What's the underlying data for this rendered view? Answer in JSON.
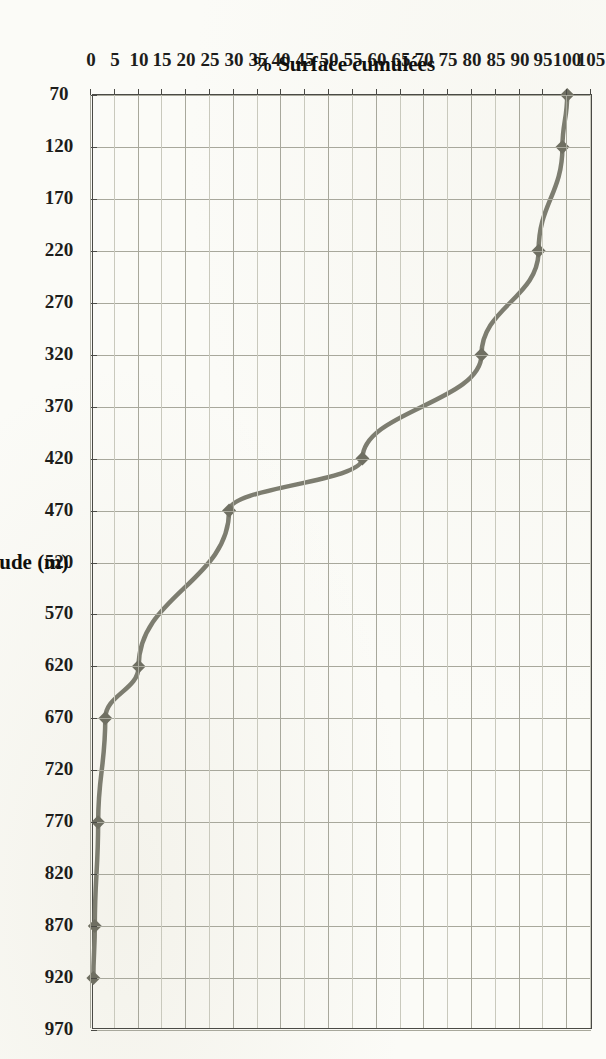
{
  "figure": {
    "orientation": "rotated-90-ccw",
    "line_color": "#7d7d70",
    "marker_color": "#6f6f62",
    "frame_color": "#4a4a45",
    "grid_color": "#a8a89c"
  },
  "chart_data": {
    "type": "line",
    "title": "",
    "xlabel": "Altitude (m)",
    "ylabel": "% Surface cumulées",
    "xlim": [
      70,
      970
    ],
    "ylim": [
      0,
      105
    ],
    "grid": true,
    "legend": "none",
    "xticks": [
      70,
      120,
      170,
      220,
      270,
      320,
      370,
      420,
      470,
      520,
      570,
      620,
      670,
      720,
      770,
      820,
      870,
      920,
      970
    ],
    "yticks": [
      0,
      5,
      10,
      15,
      20,
      25,
      30,
      35,
      40,
      45,
      50,
      55,
      60,
      65,
      70,
      75,
      80,
      85,
      90,
      95,
      100,
      105
    ],
    "series": [
      {
        "name": "% Surface cumulées",
        "x": [
          70,
          120,
          220,
          320,
          420,
          470,
          620,
          670,
          770,
          870,
          920
        ],
        "values": [
          100,
          99,
          94,
          82,
          57,
          29,
          10,
          3,
          1.5,
          0.8,
          0.5
        ]
      }
    ]
  }
}
